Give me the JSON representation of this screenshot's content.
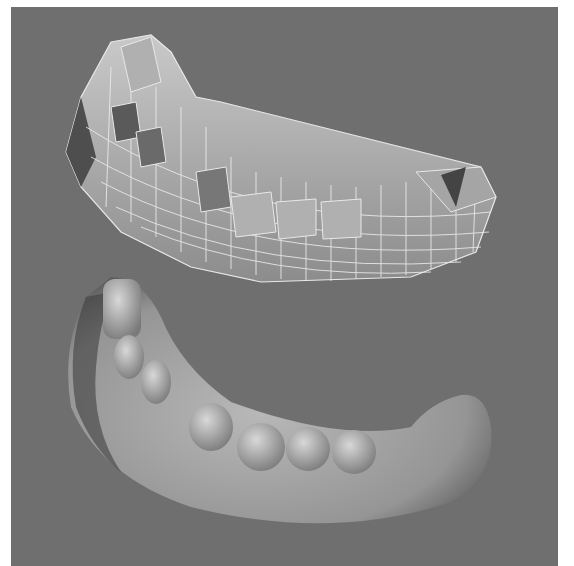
{
  "image": {
    "description": "3D render of a lower dental arch: wireframe polygon model above, smooth-shaded model below",
    "background_color": "#ffffff",
    "panel_color": "#6f6f6f",
    "subjects": [
      {
        "name": "wireframe-jaw-model",
        "shading": "flat with white mesh lines",
        "position": "top"
      },
      {
        "name": "smooth-jaw-model",
        "shading": "smooth",
        "position": "bottom"
      }
    ]
  }
}
